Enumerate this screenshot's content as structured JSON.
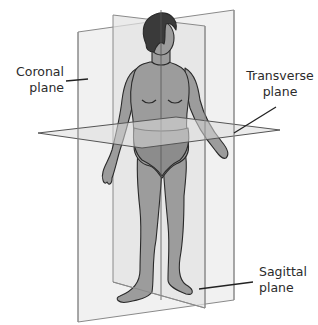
{
  "labels": {
    "coronal": {
      "line1": "Coronal",
      "line2": "plane"
    },
    "transverse": {
      "line1": "Transverse",
      "line2": "plane"
    },
    "sagittal": {
      "line1": "Sagittal",
      "line2": "plane"
    }
  },
  "colors": {
    "background": "#ffffff",
    "plane_fill": "#e9e9e9",
    "plane_edge": "#8a8a8a",
    "skin": "#9c9c9c",
    "hair": "#3a3a3a",
    "outline": "#2a2a2a",
    "leader_line": "#222222",
    "text": "#2b2b2b"
  },
  "planes": [
    "Coronal plane",
    "Transverse plane",
    "Sagittal plane"
  ]
}
